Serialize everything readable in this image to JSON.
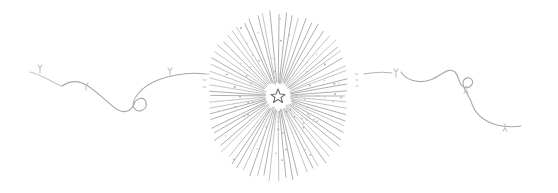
{
  "illustration": {
    "kind": "decorative-divider",
    "elements": [
      {
        "name": "left-ribbon-flourish",
        "icon": "ribbon-swirl-icon"
      },
      {
        "name": "starburst",
        "icon": "starburst-icon"
      },
      {
        "name": "center-star",
        "icon": "star-icon"
      },
      {
        "name": "right-ribbon-flourish",
        "icon": "ribbon-swirl-icon"
      }
    ],
    "colors": {
      "background": "#ffffff",
      "stroke": "#9a9a9a",
      "stroke_light": "#c4c4c4",
      "dots": "#b0b0b0",
      "star": "#6e6e6e"
    },
    "starburst": {
      "center": [
        278,
        96
      ],
      "ray_count": 72,
      "inner_radius": 12,
      "outer_radius_min": 58,
      "outer_radius_max": 86
    }
  }
}
